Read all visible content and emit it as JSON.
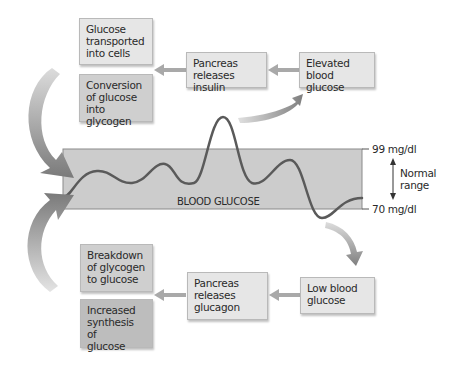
{
  "diagram": {
    "insulin_side": {
      "trigger": "Elevated blood glucose",
      "hormone": "Pancreas releases insulin",
      "effects": [
        "Glucose transported into cells",
        "Conversion of glucose into glycogen"
      ]
    },
    "glucagon_side": {
      "trigger": "Low blood glucose",
      "hormone": "Pancreas releases glucagon",
      "effects": [
        "Breakdown of glycogen to glucose",
        "Increased synthesis of glucose"
      ]
    },
    "band": {
      "label": "BLOOD GLUCOSE",
      "upper_limit": "99 mg/dl",
      "lower_limit": "70 mg/dl",
      "range_label_line1": "Normal",
      "range_label_line2": "range"
    }
  },
  "boxes": {
    "glucose_transported": {
      "l1": "Glucose",
      "l2": "transported",
      "l3": "into cells"
    },
    "conversion": {
      "l1": "Conversion",
      "l2": "of glucose",
      "l3": "into glycogen"
    },
    "pancreas_insulin": {
      "l1": "Pancreas",
      "l2": "releases insulin"
    },
    "elevated": {
      "l1": "Elevated",
      "l2": "blood glucose"
    },
    "breakdown": {
      "l1": "Breakdown",
      "l2": "of glycogen",
      "l3": "to glucose"
    },
    "increased": {
      "l1": "Increased",
      "l2": "synthesis of",
      "l3": "glucose"
    },
    "pancreas_glucagon": {
      "l1": "Pancreas",
      "l2": "releases",
      "l3": "glucagon"
    },
    "low": {
      "l1": "Low blood",
      "l2": "glucose"
    }
  },
  "colors": {
    "band_fill": "#cccccc",
    "curve": "#5a5a5a",
    "arrow": "#8a8a8a"
  }
}
